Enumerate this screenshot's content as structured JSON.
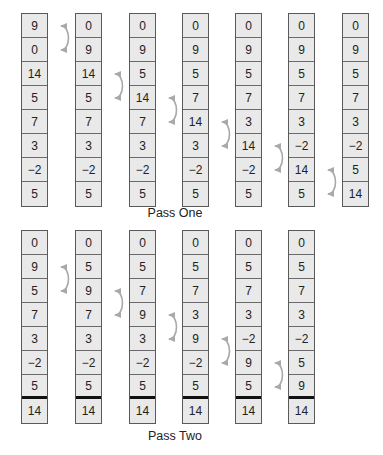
{
  "passes": [
    {
      "label": "Pass One",
      "columns": [
        {
          "values": [
            "9",
            "0",
            "14",
            "5",
            "7",
            "3",
            "−2",
            "5"
          ],
          "swap": [
            0,
            1
          ]
        },
        {
          "values": [
            "0",
            "9",
            "14",
            "5",
            "7",
            "3",
            "−2",
            "5"
          ],
          "swap": [
            2,
            3
          ]
        },
        {
          "values": [
            "0",
            "9",
            "5",
            "14",
            "7",
            "3",
            "−2",
            "5"
          ],
          "swap": [
            3,
            4
          ]
        },
        {
          "values": [
            "0",
            "9",
            "5",
            "7",
            "14",
            "3",
            "−2",
            "5"
          ],
          "swap": [
            4,
            5
          ]
        },
        {
          "values": [
            "0",
            "9",
            "5",
            "7",
            "3",
            "14",
            "−2",
            "5"
          ],
          "swap": [
            5,
            6
          ]
        },
        {
          "values": [
            "0",
            "9",
            "5",
            "7",
            "3",
            "−2",
            "14",
            "5"
          ],
          "swap": [
            6,
            7
          ]
        },
        {
          "values": [
            "0",
            "9",
            "5",
            "7",
            "3",
            "−2",
            "5",
            "14"
          ],
          "swap": null
        }
      ]
    },
    {
      "label": "Pass Two",
      "sorted_divider_after_index": 6,
      "columns": [
        {
          "values": [
            "0",
            "9",
            "5",
            "7",
            "3",
            "−2",
            "5",
            "14"
          ],
          "swap": [
            1,
            2
          ]
        },
        {
          "values": [
            "0",
            "5",
            "9",
            "7",
            "3",
            "−2",
            "5",
            "14"
          ],
          "swap": [
            2,
            3
          ]
        },
        {
          "values": [
            "0",
            "5",
            "7",
            "9",
            "3",
            "−2",
            "5",
            "14"
          ],
          "swap": [
            3,
            4
          ]
        },
        {
          "values": [
            "0",
            "5",
            "7",
            "3",
            "9",
            "−2",
            "5",
            "14"
          ],
          "swap": [
            4,
            5
          ]
        },
        {
          "values": [
            "0",
            "5",
            "7",
            "3",
            "−2",
            "9",
            "5",
            "14"
          ],
          "swap": [
            5,
            6
          ]
        },
        {
          "values": [
            "0",
            "5",
            "7",
            "3",
            "−2",
            "5",
            "9",
            "14"
          ],
          "swap": null
        }
      ]
    }
  ],
  "colors": {
    "cell_fill": "#e9e9e9",
    "cell_border": "#5a5a5a",
    "swap_arrow": "#a9a9a9",
    "sorted_divider": "#111111"
  },
  "icons": {
    "swap_arrow": "curved-double-headed-arrow"
  }
}
